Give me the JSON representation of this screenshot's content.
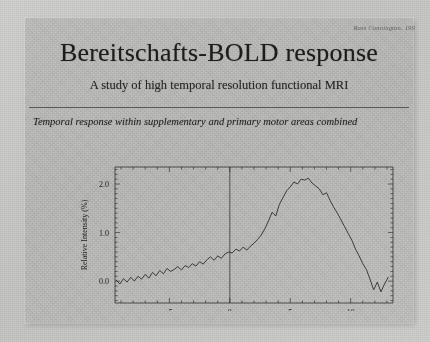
{
  "slide": {
    "credit": "Ross Cunnington, 199",
    "title": "Bereitschafts-BOLD response",
    "subtitle": "A study of high temporal resolution functional MRI",
    "chart_title": "Temporal response within supplementary and primary motor areas combined"
  },
  "chart_data": {
    "type": "line",
    "title": "Temporal response within supplementary and primary motor areas combined",
    "xlabel": "Time relative to movement (s)",
    "ylabel": "Relative Intensity (%)",
    "xlim": [
      -9.5,
      13.5
    ],
    "ylim": [
      -0.45,
      2.35
    ],
    "xticks": [
      -5,
      0,
      5,
      10
    ],
    "yticks": [
      0.0,
      1.0,
      2.0
    ],
    "xtick_labels": [
      "-5",
      "0",
      "5",
      "10"
    ],
    "ytick_labels": [
      "0.0",
      "1.0",
      "2.0"
    ],
    "grid": false,
    "legend": "none",
    "annotations": [
      {
        "type": "vline",
        "x": 0,
        "label": "movement onset"
      }
    ],
    "series": [
      {
        "name": "Relative Intensity",
        "x": [
          -9.4,
          -9.1,
          -8.8,
          -8.5,
          -8.2,
          -7.9,
          -7.6,
          -7.3,
          -7.0,
          -6.7,
          -6.4,
          -6.1,
          -5.8,
          -5.5,
          -5.2,
          -4.9,
          -4.6,
          -4.3,
          -4.0,
          -3.7,
          -3.4,
          -3.1,
          -2.8,
          -2.5,
          -2.2,
          -1.9,
          -1.6,
          -1.3,
          -1.0,
          -0.7,
          -0.4,
          -0.1,
          0.2,
          0.5,
          0.8,
          1.1,
          1.4,
          1.7,
          2.0,
          2.3,
          2.6,
          2.9,
          3.2,
          3.5,
          3.8,
          4.1,
          4.4,
          4.7,
          5.0,
          5.3,
          5.6,
          5.9,
          6.2,
          6.5,
          6.8,
          7.1,
          7.4,
          7.7,
          8.0,
          8.3,
          8.6,
          8.9,
          9.2,
          9.5,
          9.8,
          10.1,
          10.4,
          10.7,
          11.0,
          11.3,
          11.6,
          11.9,
          12.2,
          12.5,
          12.8,
          13.1
        ],
        "y": [
          0.02,
          -0.06,
          0.05,
          -0.02,
          0.08,
          0.0,
          0.1,
          0.04,
          0.14,
          0.06,
          0.18,
          0.11,
          0.22,
          0.15,
          0.26,
          0.2,
          0.24,
          0.3,
          0.23,
          0.32,
          0.28,
          0.36,
          0.31,
          0.4,
          0.35,
          0.44,
          0.5,
          0.43,
          0.52,
          0.47,
          0.56,
          0.6,
          0.58,
          0.66,
          0.62,
          0.7,
          0.64,
          0.72,
          0.78,
          0.86,
          0.95,
          1.08,
          1.24,
          1.42,
          1.34,
          1.58,
          1.72,
          1.86,
          1.94,
          2.04,
          2.0,
          2.1,
          2.08,
          2.12,
          2.02,
          1.96,
          1.9,
          1.78,
          1.82,
          1.66,
          1.52,
          1.4,
          1.26,
          1.12,
          0.98,
          0.84,
          0.66,
          0.52,
          0.36,
          0.24,
          0.04,
          -0.18,
          -0.02,
          -0.22,
          -0.06,
          0.08
        ]
      }
    ]
  }
}
